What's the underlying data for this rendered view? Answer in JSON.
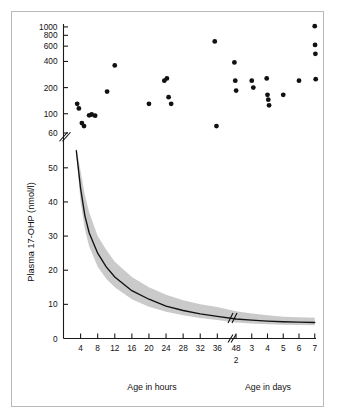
{
  "figure": {
    "border_color": "#b9b9b9",
    "background": "#ffffff"
  },
  "chart_data": {
    "type": "scatter",
    "title": "",
    "xlabel_left": "Age in hours",
    "xlabel_right": "Age in days",
    "ylabel": "Plasma 17-OHP (nmol/l)",
    "grid": false,
    "legend": null,
    "axis_breaks": {
      "y_break_between": [
        60,
        100
      ],
      "x_break_between": [
        36,
        48
      ],
      "curve_break_near_hours": 42
    },
    "y_ticks_upper": [
      1000,
      800,
      600,
      400,
      200,
      100,
      60
    ],
    "y_ticks_lower": [
      50,
      40,
      30,
      20,
      10,
      0
    ],
    "x_ticks_hours": [
      4,
      8,
      12,
      16,
      20,
      24,
      28,
      32,
      36
    ],
    "x_tick_48": "48",
    "x_tick_48_sub": "2",
    "x_ticks_days": [
      3,
      4,
      5,
      6,
      7
    ],
    "scatter_label": "Affected infants (17-OHP)",
    "scatter_points": [
      {
        "x_hours": 3.2,
        "y": 130
      },
      {
        "x_hours": 3.6,
        "y": 115
      },
      {
        "x_hours": 4.3,
        "y": 78
      },
      {
        "x_hours": 4.8,
        "y": 72
      },
      {
        "x_hours": 6.0,
        "y": 96
      },
      {
        "x_hours": 6.6,
        "y": 98
      },
      {
        "x_hours": 7.4,
        "y": 95
      },
      {
        "x_hours": 10.2,
        "y": 180
      },
      {
        "x_hours": 12.0,
        "y": 360
      },
      {
        "x_hours": 20.0,
        "y": 130
      },
      {
        "x_hours": 23.6,
        "y": 240
      },
      {
        "x_hours": 24.2,
        "y": 255
      },
      {
        "x_hours": 24.6,
        "y": 155
      },
      {
        "x_hours": 25.2,
        "y": 130
      },
      {
        "x_hours": 35.4,
        "y": 680
      },
      {
        "x_hours": 35.8,
        "y": 72
      },
      {
        "x_hours": 40.0,
        "y": 390
      },
      {
        "x_hours": 40.2,
        "y": 240
      },
      {
        "x_hours": 40.4,
        "y": 185
      },
      {
        "x_days": 3.0,
        "y": 240
      },
      {
        "x_days": 3.1,
        "y": 200
      },
      {
        "x_days": 3.95,
        "y": 255
      },
      {
        "x_days": 4.0,
        "y": 165
      },
      {
        "x_days": 4.05,
        "y": 145
      },
      {
        "x_days": 4.1,
        "y": 125
      },
      {
        "x_days": 5.0,
        "y": 165
      },
      {
        "x_days": 6.0,
        "y": 240
      },
      {
        "x_days": 7.0,
        "y": 1020
      },
      {
        "x_days": 7.02,
        "y": 620
      },
      {
        "x_days": 7.04,
        "y": 490
      },
      {
        "x_days": 7.06,
        "y": 250
      }
    ],
    "reference_curve_label": "Normal infants: mean 17-OHP decline",
    "reference_curve": [
      {
        "x_hours": 3,
        "y": 55
      },
      {
        "x_hours": 4,
        "y": 44
      },
      {
        "x_hours": 5,
        "y": 36
      },
      {
        "x_hours": 6,
        "y": 31
      },
      {
        "x_hours": 8,
        "y": 25
      },
      {
        "x_hours": 10,
        "y": 21
      },
      {
        "x_hours": 12,
        "y": 18
      },
      {
        "x_hours": 16,
        "y": 14
      },
      {
        "x_hours": 20,
        "y": 11.5
      },
      {
        "x_hours": 24,
        "y": 9.5
      },
      {
        "x_hours": 28,
        "y": 8.2
      },
      {
        "x_hours": 32,
        "y": 7.2
      },
      {
        "x_hours": 36,
        "y": 6.5
      },
      {
        "x_days": 2,
        "y": 5.7
      },
      {
        "x_days": 3,
        "y": 5.4
      },
      {
        "x_days": 4,
        "y": 5.1
      },
      {
        "x_days": 5,
        "y": 4.9
      },
      {
        "x_days": 6,
        "y": 4.8
      },
      {
        "x_days": 7,
        "y": 4.7
      }
    ],
    "confidence_band_label": "Reference range (shaded)",
    "confidence_band_upper": [
      {
        "x_hours": 3,
        "y": 56
      },
      {
        "x_hours": 4,
        "y": 49
      },
      {
        "x_hours": 5,
        "y": 42
      },
      {
        "x_hours": 6,
        "y": 37
      },
      {
        "x_hours": 8,
        "y": 30
      },
      {
        "x_hours": 10,
        "y": 26
      },
      {
        "x_hours": 12,
        "y": 22.5
      },
      {
        "x_hours": 16,
        "y": 18
      },
      {
        "x_hours": 20,
        "y": 15
      },
      {
        "x_hours": 24,
        "y": 12.8
      },
      {
        "x_hours": 28,
        "y": 11.2
      },
      {
        "x_hours": 32,
        "y": 10.0
      },
      {
        "x_hours": 36,
        "y": 9.2
      },
      {
        "x_days": 2,
        "y": 8.0
      },
      {
        "x_days": 3,
        "y": 7.3
      },
      {
        "x_days": 4,
        "y": 6.8
      },
      {
        "x_days": 5,
        "y": 6.4
      },
      {
        "x_days": 6,
        "y": 6.2
      },
      {
        "x_days": 7,
        "y": 6.1
      }
    ],
    "confidence_band_lower": [
      {
        "x_hours": 3,
        "y": 54
      },
      {
        "x_hours": 4,
        "y": 40
      },
      {
        "x_hours": 5,
        "y": 32
      },
      {
        "x_hours": 6,
        "y": 27
      },
      {
        "x_hours": 8,
        "y": 21
      },
      {
        "x_hours": 10,
        "y": 17.5
      },
      {
        "x_hours": 12,
        "y": 15
      },
      {
        "x_hours": 16,
        "y": 11.5
      },
      {
        "x_hours": 20,
        "y": 9.3
      },
      {
        "x_hours": 24,
        "y": 7.8
      },
      {
        "x_hours": 28,
        "y": 6.8
      },
      {
        "x_hours": 32,
        "y": 6.0
      },
      {
        "x_hours": 36,
        "y": 5.4
      },
      {
        "x_days": 2,
        "y": 4.7
      },
      {
        "x_days": 3,
        "y": 4.4
      },
      {
        "x_days": 4,
        "y": 4.2
      },
      {
        "x_days": 5,
        "y": 4.05
      },
      {
        "x_days": 6,
        "y": 3.95
      },
      {
        "x_days": 7,
        "y": 3.9
      }
    ]
  }
}
